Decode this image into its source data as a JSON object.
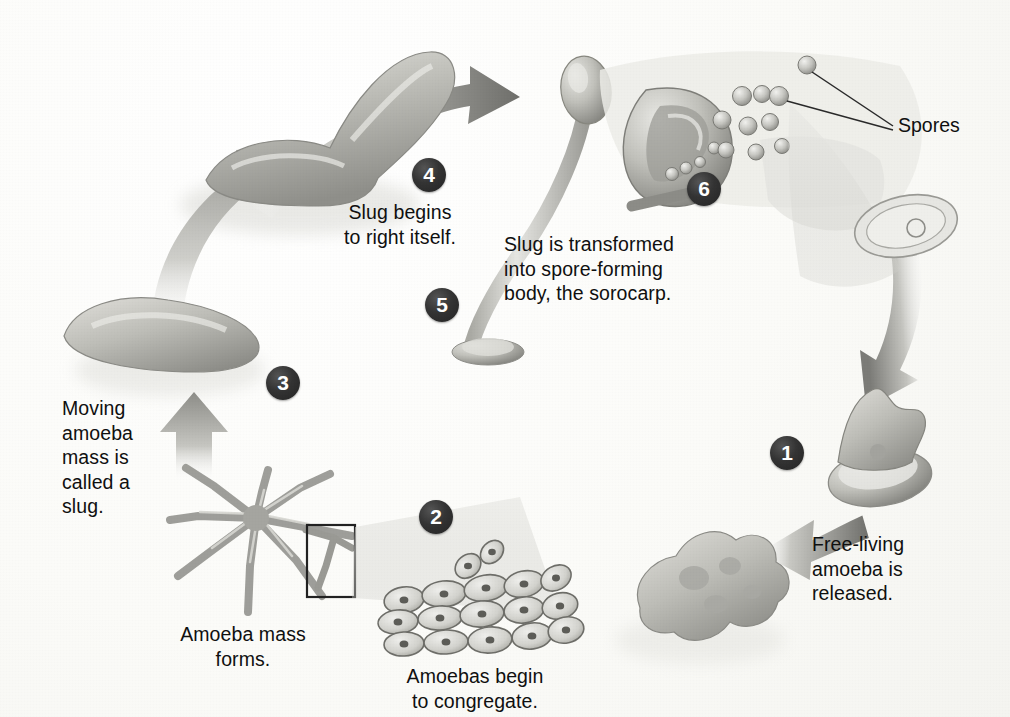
{
  "figure": {
    "background_color": "#fbfbf8",
    "ink_color": "#101010",
    "badge_color": "#2e2e2e",
    "organism_fill": "#b9b9b4",
    "arrow_color": "#9a9a96"
  },
  "callouts": {
    "spores": "Spores",
    "free_living": "Free-living\namoeba is\nreleased.",
    "congregate": "Amoebas begin\nto congregate.",
    "mass_forms": "Amoeba mass\nforms.",
    "moving_mass": "Moving\namoeba\nmass is\ncalled a\nslug.",
    "right_itself": "Slug begins\nto right itself.",
    "sorocarp": "Slug is transformed\ninto spore-forming\nbody, the sorocarp."
  },
  "stages": [
    {
      "number": "1",
      "name": "free-living-amoeba-released",
      "caption_key": "free_living"
    },
    {
      "number": "2",
      "name": "amoebas-congregate",
      "caption_key": "congregate"
    },
    {
      "number": "3",
      "name": "moving-amoeba-mass-slug",
      "caption_key": "moving_mass"
    },
    {
      "number": "4",
      "name": "slug-rights-itself",
      "caption_key": "right_itself"
    },
    {
      "number": "5",
      "name": "stalk-forms",
      "caption_key": "sorocarp"
    },
    {
      "number": "6",
      "name": "sorocarp-spore-forming-body",
      "caption_key": "sorocarp"
    }
  ],
  "badges": {
    "one": "1",
    "two": "2",
    "three": "3",
    "four": "4",
    "five": "5",
    "six": "6"
  }
}
